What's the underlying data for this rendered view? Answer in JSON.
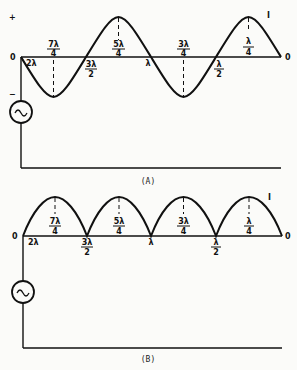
{
  "figure_a": {
    "caption": "(A)",
    "plus_sign": "+",
    "minus_sign": "−",
    "origin_left": "0",
    "origin_right": "0",
    "current_label": "I",
    "labels_above": [
      {
        "num": "7λ",
        "den": "4"
      },
      {
        "num": "5λ",
        "den": "4"
      },
      {
        "num": "3λ",
        "den": "4"
      },
      {
        "num": "λ",
        "den": "4"
      }
    ],
    "labels_below": [
      {
        "num": "2λ",
        "den": ""
      },
      {
        "num": "3λ",
        "den": "2"
      },
      {
        "num": "λ",
        "den": ""
      },
      {
        "num": "λ",
        "den": "2"
      }
    ]
  },
  "figure_b": {
    "caption": "(B)",
    "origin_left": "0",
    "origin_right": "0",
    "current_label": "I",
    "labels_above": [
      {
        "num": "7λ",
        "den": "4"
      },
      {
        "num": "5λ",
        "den": "4"
      },
      {
        "num": "3λ",
        "den": "4"
      },
      {
        "num": "λ",
        "den": "4"
      }
    ],
    "labels_below": [
      {
        "num": "2λ",
        "den": ""
      },
      {
        "num": "3λ",
        "den": "2"
      },
      {
        "num": "λ",
        "den": ""
      },
      {
        "num": "λ",
        "den": "2"
      }
    ]
  },
  "source_symbol": "~"
}
